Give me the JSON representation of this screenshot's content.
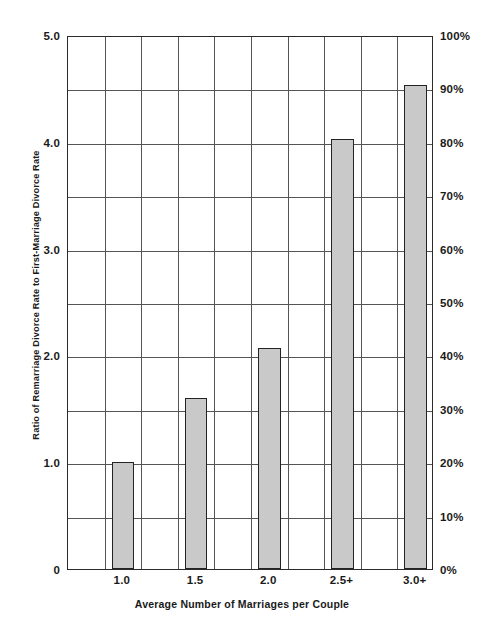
{
  "chart_data": {
    "type": "bar",
    "title": "",
    "xlabel": "Average Number of Marriages per Couple",
    "ylabel": "Ratio of Remarriage Divorce Rate to First-Marriage  Divorce Rate",
    "ylabel_right": "",
    "categories": [
      "1.0",
      "1.5",
      "2.0",
      "2.5+",
      "3.0+"
    ],
    "values": [
      1.0,
      1.6,
      2.07,
      4.03,
      4.53
    ],
    "ylim": [
      0,
      5.0
    ],
    "ylim_right": [
      0,
      100
    ],
    "yticks": [
      "0",
      "1.0",
      "2.0",
      "3.0",
      "4.0",
      "5.0"
    ],
    "ytick_values": [
      0,
      1.0,
      2.0,
      3.0,
      4.0,
      5.0
    ],
    "yticks_right": [
      "0%",
      "10%",
      "20%",
      "30%",
      "40%",
      "50%",
      "60%",
      "70%",
      "80%",
      "90%",
      "100%"
    ],
    "ytick_right_values": [
      0,
      10,
      20,
      30,
      40,
      50,
      60,
      70,
      80,
      90,
      100
    ],
    "gridlines_h_values": [
      0.5,
      1.0,
      1.5,
      2.0,
      2.5,
      3.0,
      3.5,
      4.0,
      4.5
    ],
    "grid": true,
    "legend": null,
    "bar_color": "#c9c9c9",
    "bar_edge_color": "#232323",
    "axis_color": "#2b2b2b",
    "grid_color": "#555555",
    "background": "#ffffff"
  },
  "axes": {
    "left_ticks": [
      {
        "label": "5.0",
        "value": 5.0
      },
      {
        "label": "4.0",
        "value": 4.0
      },
      {
        "label": "3.0",
        "value": 3.0
      },
      {
        "label": "2.0",
        "value": 2.0
      },
      {
        "label": "1.0",
        "value": 1.0
      },
      {
        "label": "0",
        "value": 0.0
      }
    ],
    "right_ticks": [
      {
        "label": "100%",
        "value": 100
      },
      {
        "label": "90%",
        "value": 90
      },
      {
        "label": "80%",
        "value": 80
      },
      {
        "label": "70%",
        "value": 70
      },
      {
        "label": "60%",
        "value": 60
      },
      {
        "label": "50%",
        "value": 50
      },
      {
        "label": "40%",
        "value": 40
      },
      {
        "label": "30%",
        "value": 30
      },
      {
        "label": "20%",
        "value": 20
      },
      {
        "label": "10%",
        "value": 10
      },
      {
        "label": "0%",
        "value": 0
      }
    ],
    "x_ticks": [
      {
        "label": "1.0",
        "center": 0.5
      },
      {
        "label": "1.5",
        "center": 1.5
      },
      {
        "label": "2.0",
        "center": 2.5
      },
      {
        "label": "2.5+",
        "center": 3.5
      },
      {
        "label": "3.0+",
        "center": 4.5
      }
    ]
  },
  "bars": [
    {
      "category": "1.0",
      "value": 1.0,
      "percent": 20
    },
    {
      "category": "1.5",
      "value": 1.6,
      "percent": 32
    },
    {
      "category": "2.0",
      "value": 2.07,
      "percent": 41
    },
    {
      "category": "2.5+",
      "value": 4.03,
      "percent": 81
    },
    {
      "category": "3.0+",
      "value": 4.53,
      "percent": 91
    }
  ],
  "labels": {
    "y_axis_title": "Ratio of Remarriage Divorce Rate to First-Marriage  Divorce Rate",
    "x_axis_title": "Average Number of Marriages per Couple"
  }
}
